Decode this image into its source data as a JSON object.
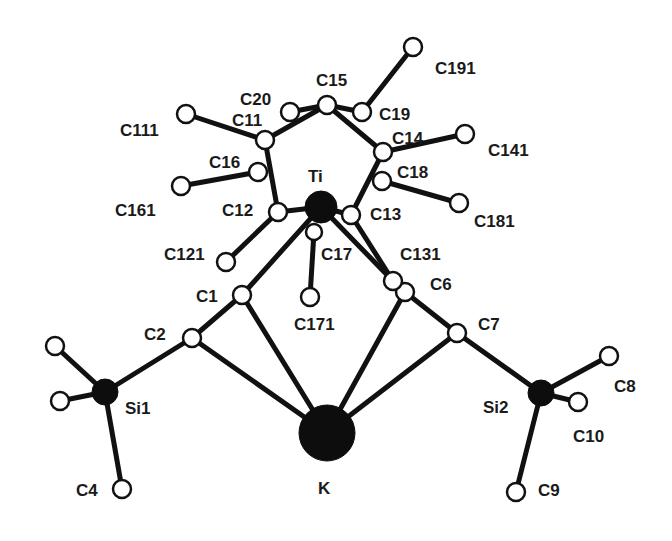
{
  "diagram": {
    "type": "molecular-structure",
    "colors": {
      "ink": "#111111",
      "background": "#ffffff",
      "open_atom_fill": "#ffffff"
    },
    "atoms": [
      {
        "id": "Ti",
        "label": "Ti",
        "x": 321,
        "y": 207,
        "r": 16,
        "filled": true,
        "lx": 308,
        "ly": 182
      },
      {
        "id": "K",
        "label": "K",
        "x": 327,
        "y": 433,
        "r": 28,
        "filled": true,
        "lx": 318,
        "ly": 494
      },
      {
        "id": "Si1",
        "label": "Si1",
        "x": 105,
        "y": 392,
        "r": 13,
        "filled": true,
        "lx": 125,
        "ly": 414
      },
      {
        "id": "Si2",
        "label": "Si2",
        "x": 541,
        "y": 393,
        "r": 13,
        "filled": true,
        "lx": 483,
        "ly": 413
      },
      {
        "id": "C1",
        "label": "C1",
        "x": 242,
        "y": 295,
        "r": 9,
        "filled": false,
        "lx": 196,
        "ly": 302
      },
      {
        "id": "C2",
        "label": "C2",
        "x": 192,
        "y": 338,
        "r": 9,
        "filled": false,
        "lx": 144,
        "ly": 340
      },
      {
        "id": "C4",
        "label": "C4",
        "x": 122,
        "y": 489,
        "r": 9,
        "filled": false,
        "lx": 76,
        "ly": 496
      },
      {
        "id": "C3",
        "label": "",
        "x": 55,
        "y": 346,
        "r": 9,
        "filled": false,
        "lx": 0,
        "ly": 0
      },
      {
        "id": "C5",
        "label": "",
        "x": 60,
        "y": 401,
        "r": 9,
        "filled": false,
        "lx": 0,
        "ly": 0
      },
      {
        "id": "C6",
        "label": "C6",
        "x": 405,
        "y": 292,
        "r": 9,
        "filled": false,
        "lx": 430,
        "ly": 290
      },
      {
        "id": "C7",
        "label": "C7",
        "x": 457,
        "y": 333,
        "r": 9,
        "filled": false,
        "lx": 478,
        "ly": 330
      },
      {
        "id": "C8",
        "label": "C8",
        "x": 609,
        "y": 356,
        "r": 9,
        "filled": false,
        "lx": 614,
        "ly": 392
      },
      {
        "id": "C9",
        "label": "C9",
        "x": 516,
        "y": 492,
        "r": 9,
        "filled": false,
        "lx": 538,
        "ly": 496
      },
      {
        "id": "C10",
        "label": "C10",
        "x": 578,
        "y": 402,
        "r": 9,
        "filled": false,
        "lx": 573,
        "ly": 442
      },
      {
        "id": "C11",
        "label": "C11",
        "x": 265,
        "y": 140,
        "r": 9,
        "filled": false,
        "lx": 232,
        "ly": 126
      },
      {
        "id": "C12",
        "label": "C12",
        "x": 278,
        "y": 212,
        "r": 9,
        "filled": false,
        "lx": 222,
        "ly": 216
      },
      {
        "id": "C13",
        "label": "C13",
        "x": 351,
        "y": 215,
        "r": 9,
        "filled": false,
        "lx": 370,
        "ly": 220
      },
      {
        "id": "C14",
        "label": "C14",
        "x": 383,
        "y": 152,
        "r": 9,
        "filled": false,
        "lx": 392,
        "ly": 144
      },
      {
        "id": "C15",
        "label": "C15",
        "x": 327,
        "y": 105,
        "r": 9,
        "filled": false,
        "lx": 316,
        "ly": 86
      },
      {
        "id": "C16",
        "label": "C16",
        "x": 258,
        "y": 172,
        "r": 9,
        "filled": false,
        "lx": 209,
        "ly": 168
      },
      {
        "id": "C17",
        "label": "C17",
        "x": 314,
        "y": 232,
        "r": 8,
        "filled": false,
        "lx": 321,
        "ly": 260
      },
      {
        "id": "C18",
        "label": "C18",
        "x": 382,
        "y": 181,
        "r": 9,
        "filled": false,
        "lx": 397,
        "ly": 178
      },
      {
        "id": "C19",
        "label": "C19",
        "x": 362,
        "y": 112,
        "r": 9,
        "filled": false,
        "lx": 379,
        "ly": 120
      },
      {
        "id": "C20",
        "label": "C20",
        "x": 290,
        "y": 112,
        "r": 9,
        "filled": false,
        "lx": 240,
        "ly": 105
      },
      {
        "id": "C111",
        "label": "C111",
        "x": 186,
        "y": 114,
        "r": 9,
        "filled": false,
        "lx": 120,
        "ly": 136
      },
      {
        "id": "C121",
        "label": "C121",
        "x": 226,
        "y": 262,
        "r": 9,
        "filled": false,
        "lx": 164,
        "ly": 260
      },
      {
        "id": "C131",
        "label": "C131",
        "x": 393,
        "y": 281,
        "r": 9,
        "filled": false,
        "lx": 400,
        "ly": 260
      },
      {
        "id": "C141",
        "label": "C141",
        "x": 465,
        "y": 134,
        "r": 9,
        "filled": false,
        "lx": 488,
        "ly": 156
      },
      {
        "id": "C161",
        "label": "C161",
        "x": 181,
        "y": 186,
        "r": 9,
        "filled": false,
        "lx": 115,
        "ly": 216
      },
      {
        "id": "C171",
        "label": "C171",
        "x": 310,
        "y": 297,
        "r": 9,
        "filled": false,
        "lx": 294,
        "ly": 330
      },
      {
        "id": "C181",
        "label": "C181",
        "x": 459,
        "y": 203,
        "r": 9,
        "filled": false,
        "lx": 474,
        "ly": 227
      },
      {
        "id": "C191",
        "label": "C191",
        "x": 413,
        "y": 47,
        "r": 9,
        "filled": false,
        "lx": 435,
        "ly": 74
      }
    ],
    "bonds": [
      [
        "C11",
        "C15"
      ],
      [
        "C15",
        "C14"
      ],
      [
        "C14",
        "C13"
      ],
      [
        "C11",
        "C12"
      ],
      [
        "C11",
        "C111"
      ],
      [
        "C15",
        "C20"
      ],
      [
        "C15",
        "C19"
      ],
      [
        "C19",
        "C191"
      ],
      [
        "C14",
        "C141"
      ],
      [
        "C16",
        "C161"
      ],
      [
        "C18",
        "C181"
      ],
      [
        "C12",
        "Ti"
      ],
      [
        "C13",
        "Ti"
      ],
      [
        "C12",
        "C121"
      ],
      [
        "C17",
        "C171"
      ],
      [
        "Ti",
        "C131"
      ],
      [
        "C13",
        "C131"
      ],
      [
        "Ti",
        "C1"
      ],
      [
        "C1",
        "C2"
      ],
      [
        "C1",
        "K"
      ],
      [
        "C2",
        "K"
      ],
      [
        "C6",
        "C7"
      ],
      [
        "C6",
        "K"
      ],
      [
        "C7",
        "K"
      ],
      [
        "C2",
        "Si1"
      ],
      [
        "Si1",
        "C3"
      ],
      [
        "Si1",
        "C5"
      ],
      [
        "Si1",
        "C4"
      ],
      [
        "C7",
        "Si2"
      ],
      [
        "Si2",
        "C8"
      ],
      [
        "Si2",
        "C10"
      ],
      [
        "Si2",
        "C9"
      ]
    ]
  }
}
